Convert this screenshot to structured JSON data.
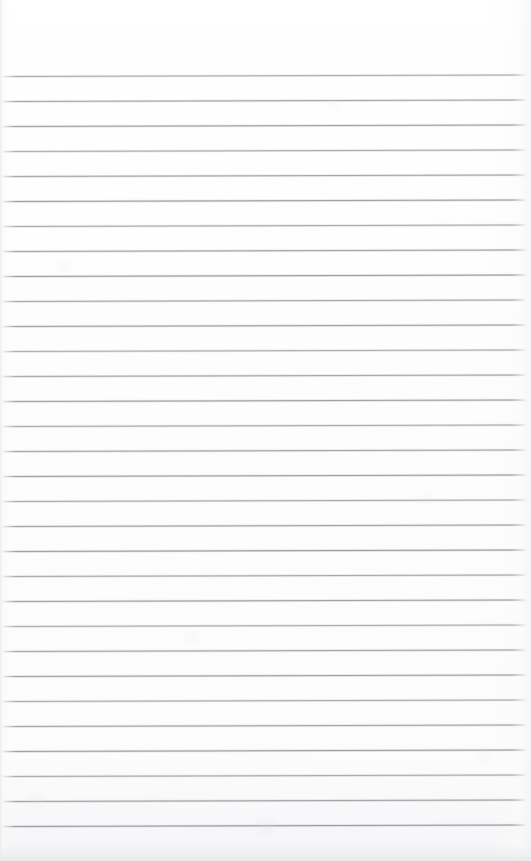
{
  "document": {
    "kind": "scanned-lined-paper",
    "title": "Blank ruled notepad page",
    "page_width_px": 531,
    "page_height_px": 861,
    "background_color": "#ffffff",
    "content_text": "",
    "handwriting_present": "none",
    "top_margin_label": ""
  },
  "ruling": {
    "line_color": "#9a9aa0",
    "line_thickness_px": 1,
    "line_spacing_px": 25,
    "first_line_y_px": 76,
    "last_line_y_px": 844,
    "line_count": 32,
    "left_inset_px": 2,
    "right_inset_px": 5,
    "tilt_px_over_width": -1.5,
    "style": "horizontal-ruled",
    "margin_rule": "none"
  },
  "scan": {
    "edge_tint_color": "#ececee",
    "bottom_shadow_color": "#e7e7eb",
    "noise_opacity": "0.5"
  }
}
